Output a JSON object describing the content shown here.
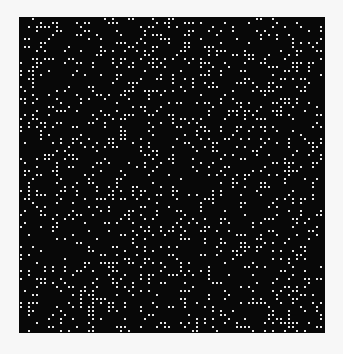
{
  "image": {
    "description": "Random white dot pattern on black square",
    "background_color": "#f7f7f7",
    "field_color": "#080808",
    "dot_color": "#e6e6e6",
    "field": {
      "x": 19,
      "y": 17,
      "width": 306,
      "height": 316
    },
    "cell_pitch": 4,
    "dot_size": 2,
    "density": 0.23,
    "seed": 1337
  }
}
